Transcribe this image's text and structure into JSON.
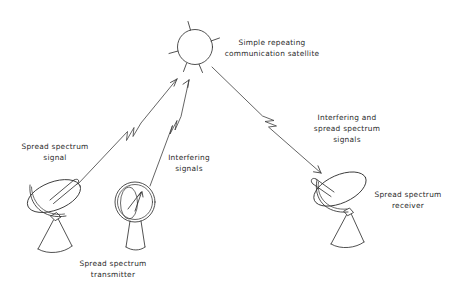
{
  "canvas": {
    "width": 459,
    "height": 286,
    "background": "#ffffff",
    "ink": "#333333",
    "text_color": "#2a2a2a"
  },
  "diagram": {
    "title_absent": true,
    "nodes": [
      {
        "id": "satellite",
        "icon": "satellite-icon",
        "shape": "circle-with-antenna-spikes",
        "center": [
          195,
          47
        ],
        "radius": 18,
        "spike_count": 5,
        "label_lines": [
          "Simple repeating",
          "communication satellite"
        ],
        "label_anchor": [
          272,
          46
        ]
      },
      {
        "id": "transmitter",
        "icon": "dish-antenna-icon",
        "shape": "tilted-parabolic-dish",
        "center": [
          57,
          207
        ],
        "label_lines": [
          "Spread spectrum",
          "transmitter"
        ],
        "label_anchor": [
          63,
          265
        ],
        "signal_label_lines": [
          "Spread spectrum",
          "signal"
        ],
        "signal_label_anchor": [
          55,
          155
        ]
      },
      {
        "id": "interferer",
        "icon": "front-facing-dish-icon",
        "shape": "circular-dish-front-view",
        "center": [
          133,
          205
        ],
        "label_lines": [
          "Interfering",
          "signals"
        ],
        "label_anchor": [
          189,
          160
        ]
      },
      {
        "id": "receiver",
        "icon": "dish-antenna-icon",
        "shape": "tilted-parabolic-dish-mirrored",
        "center": [
          338,
          195
        ],
        "label_lines": [
          "Spread spectrum",
          "receiver"
        ],
        "label_anchor": [
          404,
          196
        ],
        "signal_label_lines": [
          "Interfering and",
          "spread spectrum",
          "signals"
        ],
        "signal_label_anchor": [
          345,
          122
        ]
      }
    ],
    "links": [
      {
        "id": "uplink-spread-spectrum",
        "from": "transmitter",
        "to": "satellite",
        "start": [
          78,
          184
        ],
        "end": [
          177,
          79
        ],
        "squiggle": true,
        "arrowhead": "end"
      },
      {
        "id": "uplink-interference",
        "from": "interferer",
        "to": "satellite",
        "start": [
          150,
          186
        ],
        "end": [
          189,
          80
        ],
        "squiggle": true,
        "arrowhead": "end"
      },
      {
        "id": "downlink-combined",
        "from": "satellite",
        "to": "receiver",
        "start": [
          212,
          67
        ],
        "end": [
          321,
          173
        ],
        "squiggle": true,
        "arrowhead": "end"
      }
    ]
  },
  "labels": {
    "satellite_line1": "Simple repeating",
    "satellite_line2": "communication satellite",
    "spread_signal_line1": "Spread spectrum",
    "spread_signal_line2": "signal",
    "transmitter_line1": "Spread spectrum",
    "transmitter_line2": "transmitter",
    "interfering_line1": "Interfering",
    "interfering_line2": "signals",
    "combined_line1": "Interfering and",
    "combined_line2": "spread spectrum",
    "combined_line3": "signals",
    "receiver_line1": "Spread spectrum",
    "receiver_line2": "receiver"
  }
}
